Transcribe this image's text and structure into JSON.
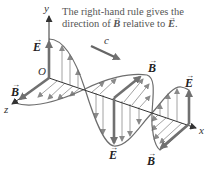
{
  "caption": {
    "line1": "The right-hand rule gives the",
    "line2_prefix": "direction of ",
    "line2_b": "B",
    "line2_mid": " relative to ",
    "line2_e": "E",
    "line2_suffix": "."
  },
  "axes": {
    "y": "y",
    "x": "x",
    "z": "z",
    "origin": "O"
  },
  "wave_speed_label": "c",
  "vector_arrow_glyph": "→",
  "labels": {
    "e_left": "E",
    "b_left": "B",
    "b_middle": "B",
    "e_middle": "E",
    "e_right": "E",
    "b_right": "B"
  },
  "colors": {
    "curve": "#6e6e6e",
    "field_arrow": "#8a8a8a",
    "thick_arrow": "#7a7a7a",
    "axis": "#333333",
    "text": "#555555"
  }
}
